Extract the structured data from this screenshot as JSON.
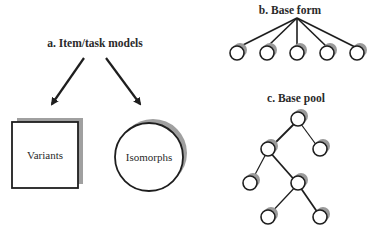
{
  "panel_a": {
    "title": "a.  Item/task models",
    "square_label": "Variants",
    "circle_label": "Isomorphs"
  },
  "panel_b": {
    "title": "b.  Base form",
    "node_count": 5
  },
  "panel_c": {
    "title": "c.  Base pool",
    "node_count": 7
  },
  "colors": {
    "stroke": "#1e1e1e",
    "shadow": "#9a9a9a",
    "background": "#ffffff"
  }
}
